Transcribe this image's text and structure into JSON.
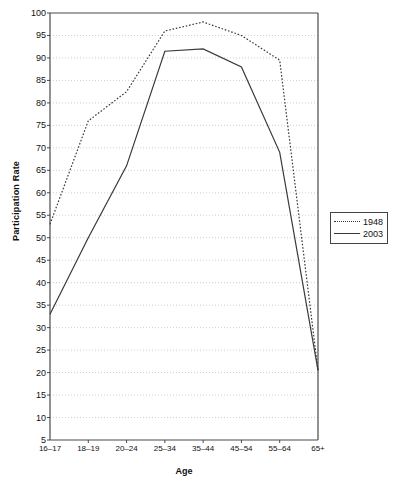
{
  "chart_data": {
    "type": "line",
    "title": "",
    "xlabel": "Age",
    "ylabel": "Participation Rate",
    "categories": [
      "16–17",
      "18–19",
      "20–24",
      "25–34",
      "35–44",
      "45–54",
      "55–64",
      "65+"
    ],
    "ylim": [
      5,
      100
    ],
    "yticks": [
      5,
      10,
      15,
      20,
      25,
      30,
      35,
      40,
      45,
      50,
      55,
      60,
      65,
      70,
      75,
      80,
      85,
      90,
      95,
      100
    ],
    "grid": "horizontal-dotted",
    "legend_position": "right-outside",
    "series": [
      {
        "name": "1948",
        "style": "dotted",
        "color": "#3a3a3a",
        "values": [
          53,
          76,
          82.5,
          96,
          98,
          95,
          89.5,
          20.5
        ]
      },
      {
        "name": "2003",
        "style": "solid",
        "color": "#3a3a3a",
        "values": [
          33,
          50,
          66,
          91.5,
          92,
          88,
          69,
          20.5
        ]
      }
    ]
  },
  "legend": {
    "items": [
      {
        "label": "1948"
      },
      {
        "label": "2003"
      }
    ]
  }
}
